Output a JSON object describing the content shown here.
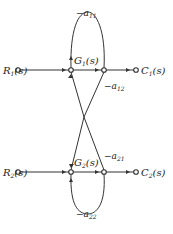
{
  "diagram": {
    "type": "signal-flow-graph",
    "nodes": {
      "R1": {
        "name": "R",
        "sub": "1",
        "arg": "(s)"
      },
      "C1": {
        "name": "C",
        "sub": "1",
        "arg": "(s)"
      },
      "R2": {
        "name": "R",
        "sub": "2",
        "arg": "(s)"
      },
      "C2": {
        "name": "C",
        "sub": "2",
        "arg": "(s)"
      }
    },
    "gains": {
      "G1": {
        "name": "G",
        "sub": "1",
        "arg": "(s)"
      },
      "G2": {
        "name": "G",
        "sub": "2",
        "arg": "(s)"
      },
      "a11": {
        "prefix": "−a",
        "sub": "11"
      },
      "a12": {
        "prefix": "−a",
        "sub": "12"
      },
      "a21": {
        "prefix": "−a",
        "sub": "21"
      },
      "a22": {
        "prefix": "−a",
        "sub": "22"
      }
    }
  }
}
